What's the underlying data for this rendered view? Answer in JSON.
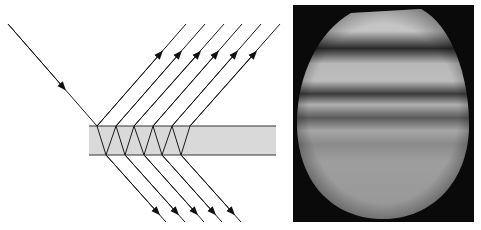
{
  "figure": {
    "left_panel": {
      "type": "thin-film multiple-beam interference ray diagram",
      "incident_ray": {
        "from": [
          8,
          24
        ],
        "to": [
          97,
          126
        ]
      },
      "slab": {
        "x": 89,
        "y": 126,
        "width": 187,
        "height": 29,
        "fill": "#d9d9d9",
        "edge": "#333333"
      },
      "top_vertices_x": [
        97,
        116,
        134,
        153,
        172,
        190
      ],
      "bottom_vertices_x": [
        106,
        125,
        144,
        162,
        181
      ],
      "reflected_ray_count": 6,
      "transmitted_ray_count": 5,
      "ray_color": "#1a1a1a"
    },
    "right_panel": {
      "type": "interference fringe photograph",
      "background": "#0a0a0a",
      "fringe_count_dark": 4
    }
  }
}
